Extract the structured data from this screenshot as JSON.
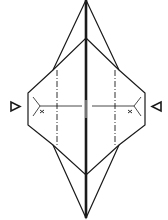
{
  "diagram": {
    "type": "origami-folding-step",
    "colors": {
      "line": "#1a1a1a",
      "background": "#ffffff"
    },
    "symbols": {
      "left_arrow": "push-arrow-right",
      "right_arrow": "push-arrow-left",
      "left_mark": "x",
      "right_mark": "x"
    },
    "fold_lines": {
      "center": "thick-valley-center",
      "left_dashdot": "mountain-fold",
      "right_dashdot": "mountain-fold"
    }
  }
}
